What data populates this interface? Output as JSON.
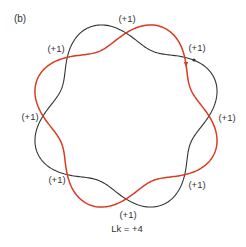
{
  "panel_label": "(b)",
  "summary": "Lk = +4",
  "colors": {
    "strand_a": "#d83a22",
    "strand_b": "#333333",
    "text": "#333333",
    "background": "#ffffff"
  },
  "geometry": {
    "center": [
      126,
      116
    ],
    "radius": 83,
    "amplitude": 13,
    "periods": 4
  },
  "crossings": [
    {
      "id": "top",
      "label": "(+1)",
      "pos": [
        127,
        19
      ]
    },
    {
      "id": "upper-right",
      "label": "(+1)",
      "pos": [
        197,
        48
      ]
    },
    {
      "id": "right",
      "label": "(+1)",
      "pos": [
        227,
        118
      ]
    },
    {
      "id": "lower-right",
      "label": "(+1)",
      "pos": [
        197,
        185
      ]
    },
    {
      "id": "bottom",
      "label": "(+1)",
      "pos": [
        128,
        215
      ]
    },
    {
      "id": "lower-left",
      "label": "(+1)",
      "pos": [
        57,
        180
      ]
    },
    {
      "id": "left",
      "label": "(+1)",
      "pos": [
        30,
        117
      ]
    },
    {
      "id": "upper-left",
      "label": "(+1)",
      "pos": [
        56,
        49
      ]
    }
  ],
  "markers": {
    "strand_a_arrow": {
      "pos": [
        186,
        65
      ],
      "direction": "down"
    },
    "strand_b_arrow": {
      "pos": [
        194,
        60
      ],
      "direction": "right"
    }
  }
}
